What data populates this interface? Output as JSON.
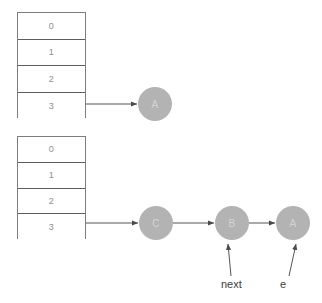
{
  "diagram": {
    "type": "linked-list-hash-table",
    "background_color": "#ffffff",
    "node_fill_color": "#b3b3b3",
    "node_text_color": "#d4d4d4",
    "table_border_color": "#5e5e5e",
    "index_text_color": "#8f8f8f",
    "arrow_color": "#555555",
    "label_color": "#3c3c3c"
  },
  "tables": [
    {
      "name": "top-bucket-array",
      "x": 17,
      "y": 12,
      "width": 69,
      "height": 106,
      "cells": [
        {
          "index": "0"
        },
        {
          "index": "1"
        },
        {
          "index": "2"
        },
        {
          "index": "3"
        }
      ]
    },
    {
      "name": "bottom-bucket-array",
      "x": 17,
      "y": 136,
      "width": 69,
      "height": 103,
      "cells": [
        {
          "index": "0"
        },
        {
          "index": "1"
        },
        {
          "index": "2"
        },
        {
          "index": "3"
        }
      ]
    }
  ],
  "nodes": [
    {
      "name": "node-a-top",
      "label": "A",
      "cx": 155,
      "cy": 104,
      "r": 17
    },
    {
      "name": "node-c-bottom",
      "label": "C",
      "cx": 156,
      "cy": 223,
      "r": 17
    },
    {
      "name": "node-b-bottom",
      "label": "B",
      "cx": 232,
      "cy": 223,
      "r": 17
    },
    {
      "name": "node-a-bottom",
      "label": "A",
      "cx": 293,
      "cy": 223,
      "r": 17
    }
  ],
  "arrows": [
    {
      "name": "arrow-top-bucket3-to-a",
      "x1": 86,
      "y1": 104,
      "x2": 137,
      "y2": 104
    },
    {
      "name": "arrow-bottom-bucket3-to-c",
      "x1": 86,
      "y1": 223,
      "x2": 138,
      "y2": 223
    },
    {
      "name": "arrow-c-to-b",
      "x1": 173,
      "y1": 223,
      "x2": 214,
      "y2": 223
    },
    {
      "name": "arrow-b-to-a",
      "x1": 249,
      "y1": 223,
      "x2": 275,
      "y2": 223
    },
    {
      "name": "arrow-next-to-b",
      "x1": 231,
      "y1": 276,
      "x2": 228,
      "y2": 244
    },
    {
      "name": "arrow-e-to-a",
      "x1": 289,
      "y1": 276,
      "x2": 296,
      "y2": 244
    }
  ],
  "labels": [
    {
      "name": "label-next",
      "text": "next",
      "x": 221,
      "y": 278
    },
    {
      "name": "label-e",
      "text": "e",
      "x": 280,
      "y": 278
    }
  ]
}
